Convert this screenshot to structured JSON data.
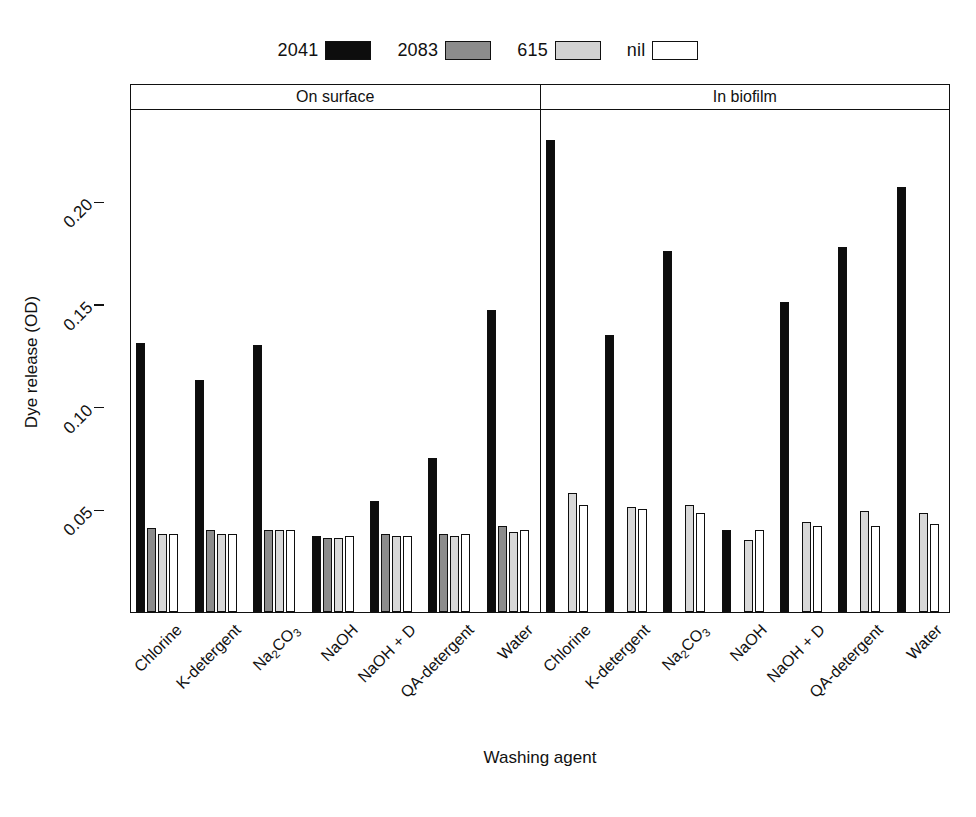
{
  "chart_data": {
    "type": "bar",
    "title": "",
    "xlabel": "Washing agent",
    "ylabel": "Dye release (OD)",
    "ylim": [
      0.0,
      0.245
    ],
    "yticks": [
      0.05,
      0.1,
      0.15,
      0.2
    ],
    "ytick_labels": [
      "0.05",
      "0.10",
      "0.15",
      "0.20"
    ],
    "grid": false,
    "legend_position": "top-center",
    "panels": [
      {
        "name": "On surface",
        "categories": [
          "Chlorine",
          "K-detergent",
          "Na2CO3",
          "NaOH",
          "NaOH + D",
          "QA-detergent",
          "Water"
        ],
        "series": [
          {
            "name": "2041",
            "values": [
              0.131,
              0.113,
              0.13,
              0.037,
              0.054,
              0.075,
              0.147
            ]
          },
          {
            "name": "2083",
            "values": [
              0.041,
              0.04,
              0.04,
              0.036,
              0.038,
              0.038,
              0.042
            ]
          },
          {
            "name": "615",
            "values": [
              0.038,
              0.038,
              0.04,
              0.036,
              0.037,
              0.037,
              0.039
            ]
          },
          {
            "name": "nil",
            "values": [
              0.038,
              0.038,
              0.04,
              0.037,
              0.037,
              0.038,
              0.04
            ]
          }
        ]
      },
      {
        "name": "In biofilm",
        "categories": [
          "Chlorine",
          "K-detergent",
          "Na2CO3",
          "NaOH",
          "NaOH + D",
          "QA-detergent",
          "Water"
        ],
        "series": [
          {
            "name": "2041",
            "values": [
              0.23,
              0.135,
              0.176,
              0.04,
              0.151,
              0.178,
              0.207
            ]
          },
          {
            "name": "2083",
            "values": [
              0.0,
              0.0,
              0.0,
              0.0,
              0.0,
              0.0,
              0.0
            ]
          },
          {
            "name": "615",
            "values": [
              0.058,
              0.051,
              0.052,
              0.035,
              0.044,
              0.049,
              0.048
            ]
          },
          {
            "name": "nil",
            "values": [
              0.052,
              0.05,
              0.048,
              0.04,
              0.042,
              0.042,
              0.043
            ]
          }
        ]
      }
    ]
  },
  "legend": {
    "items": [
      {
        "label": "2041",
        "color": "#0d0d0d"
      },
      {
        "label": "2083",
        "color": "#8c8c8c"
      },
      {
        "label": "615",
        "color": "#d2d2d2"
      },
      {
        "label": "nil",
        "color": "#ffffff"
      }
    ]
  },
  "axes": {
    "y_title": "Dye release (OD)",
    "x_title": "Washing agent",
    "y_tick_labels": [
      "0.05",
      "0.10",
      "0.15",
      "0.20"
    ]
  },
  "strips": [
    {
      "label": "On surface"
    },
    {
      "label": "In biofilm"
    }
  ],
  "x_categories": [
    {
      "label": "Chlorine",
      "html": "Chlorine"
    },
    {
      "label": "K-detergent",
      "html": "K-detergent"
    },
    {
      "label": "Na2CO3",
      "html": "Na<sub>2</sub>CO<sub>3</sub>"
    },
    {
      "label": "NaOH",
      "html": "NaOH"
    },
    {
      "label": "NaOH + D",
      "html": "NaOH + D"
    },
    {
      "label": "QA-detergent",
      "html": "QA-detergent"
    },
    {
      "label": "Water",
      "html": "Water"
    }
  ]
}
